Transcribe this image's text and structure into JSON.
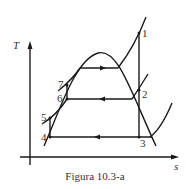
{
  "figure": {
    "caption": "Figura 10.3-a",
    "axes": {
      "y_label": "T",
      "x_label": "s"
    },
    "points": [
      {
        "label": "1",
        "x": 139,
        "y": 33
      },
      {
        "label": "2",
        "x": 139,
        "y": 90
      },
      {
        "label": "3",
        "x": 139,
        "y": 137
      },
      {
        "label": "4",
        "x": 50,
        "y": 137
      },
      {
        "label": "5",
        "x": 50,
        "y": 118
      },
      {
        "label": "6",
        "x": 67,
        "y": 99
      },
      {
        "label": "7",
        "x": 67,
        "y": 85
      }
    ],
    "colors": {
      "line": "#1a1a1a",
      "text": "#333333"
    }
  }
}
